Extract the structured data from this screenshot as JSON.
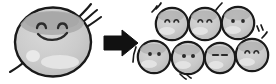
{
  "figure": {
    "title": "Cell division illustration",
    "description": "One large gray blob character with a smiling face divides into seven small blob characters",
    "background_color": "#ffffff",
    "outline_color": "#1a1a1a",
    "body_fill": "#c9c9c9",
    "body_fill_light": "#d6d6d6",
    "shadow_band_color": "#a8a8a8",
    "highlight_color": "#e8e8e8",
    "arrow_color": "#111111",
    "face_stroke_color": "#2b2b2b"
  },
  "parent": {
    "name": "large-blob",
    "label": "Large blob with smiling face",
    "center_x": 53,
    "center_y": 42,
    "radius_x": 39,
    "radius_y": 35,
    "face": {
      "eyes": "arched",
      "mouth": "smile",
      "eye_left_x": 41,
      "eye_right_x": 62,
      "eye_y": 26,
      "mouth_y": 36
    },
    "highlights": [
      {
        "name": "highlight-small-circle",
        "cx": 33,
        "cy": 56,
        "rx": 7,
        "ry": 6
      },
      {
        "name": "highlight-oval",
        "cx": 60,
        "cy": 62,
        "rx": 19,
        "ry": 7
      }
    ],
    "motion_lines_top_right": 3,
    "motion_lines_bottom_left": 1
  },
  "arrow": {
    "name": "transformation-arrow",
    "label": "becomes",
    "direction": "right",
    "x": 104,
    "y": 32,
    "width": 34,
    "height": 22
  },
  "children": {
    "count": 7,
    "rows": [
      {
        "name": "top-row",
        "count": 3,
        "items": [
          {
            "name": "small-blob-1",
            "cx": 172,
            "cy": 24,
            "r": 17,
            "eyes": "arched",
            "motion": "top-left"
          },
          {
            "name": "small-blob-2",
            "cx": 205,
            "cy": 24,
            "r": 17,
            "eyes": "arched",
            "motion": "top-right"
          },
          {
            "name": "small-blob-3",
            "cx": 238,
            "cy": 23,
            "r": 17,
            "eyes": "dots",
            "motion": "right"
          }
        ]
      },
      {
        "name": "bottom-row",
        "count": 4,
        "items": [
          {
            "name": "small-blob-4",
            "cx": 154,
            "cy": 57,
            "r": 17,
            "eyes": "dots",
            "motion": "left"
          },
          {
            "name": "small-blob-5",
            "cx": 188,
            "cy": 58,
            "r": 17,
            "eyes": "dots",
            "motion": "bottom-right"
          },
          {
            "name": "small-blob-6",
            "cx": 220,
            "cy": 58,
            "r": 16,
            "eyes": "dashes",
            "motion": "none"
          },
          {
            "name": "small-blob-7",
            "cx": 252,
            "cy": 55,
            "r": 17,
            "eyes": "arched",
            "motion": "top-right"
          }
        ]
      }
    ]
  }
}
